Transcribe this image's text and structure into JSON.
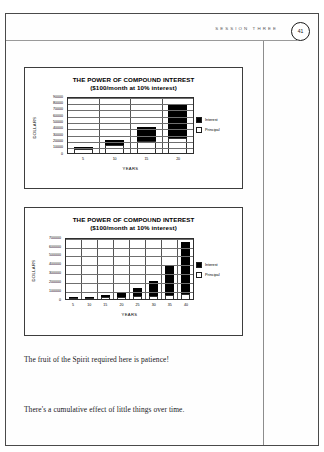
{
  "header": {
    "session_label": "SESSION THREE",
    "page_number": "41"
  },
  "charts": [
    {
      "title": "THE POWER OF COMPOUND INTEREST",
      "subtitle": "($100/month at 10% interest)",
      "ylabel": "DOLLARS",
      "xlabel": "YEARS",
      "legend": [
        {
          "label": "Interest",
          "swatch": "filled"
        },
        {
          "label": "Principal",
          "swatch": "hollow"
        }
      ]
    },
    {
      "title": "THE POWER OF COMPOUND INTEREST",
      "subtitle": "($100/month at 10% interest)",
      "ylabel": "DOLLARS",
      "xlabel": "YEARS",
      "legend": [
        {
          "label": "Interest",
          "swatch": "filled"
        },
        {
          "label": "Principal",
          "swatch": "hollow"
        }
      ]
    }
  ],
  "body": {
    "line_1": "The fruit of the Spirit required here is patience!",
    "line_2": "There's a cumulative effect of little things over time."
  },
  "chart_data": [
    {
      "type": "bar",
      "stacked": true,
      "title": "THE POWER OF COMPOUND INTEREST",
      "subtitle": "($100/month at 10% interest)",
      "xlabel": "YEARS",
      "ylabel": "DOLLARS",
      "categories": [
        "5",
        "10",
        "15",
        "20"
      ],
      "ytick_labels": [
        "90000",
        "80000",
        "70000",
        "60000",
        "50000",
        "40000",
        "30000",
        "20000",
        "10000",
        "0"
      ],
      "ylim": [
        0,
        90000
      ],
      "ytick_step": 10000,
      "grid": true,
      "legend_position": "right",
      "series": [
        {
          "name": "Principal",
          "color": "#ffffff",
          "values": [
            6000,
            12000,
            18000,
            24000
          ]
        },
        {
          "name": "Interest",
          "color": "#000000",
          "values": [
            3800,
            8200,
            22000,
            52000
          ]
        }
      ],
      "totals": [
        9800,
        20200,
        40000,
        76000
      ]
    },
    {
      "type": "bar",
      "stacked": true,
      "title": "THE POWER OF COMPOUND INTEREST",
      "subtitle": "($100/month at 10% interest)",
      "xlabel": "YEARS",
      "ylabel": "DOLLARS",
      "categories": [
        "5",
        "10",
        "15",
        "20",
        "25",
        "30",
        "35",
        "40"
      ],
      "ytick_labels": [
        "700000",
        "600000",
        "500000",
        "400000",
        "300000",
        "200000",
        "100000",
        "0"
      ],
      "ylim": [
        0,
        700000
      ],
      "ytick_step": 100000,
      "grid": true,
      "legend_position": "right",
      "series": [
        {
          "name": "Principal",
          "color": "#ffffff",
          "values": [
            6000,
            12000,
            18000,
            24000,
            30000,
            36000,
            42000,
            48000
          ]
        },
        {
          "name": "Interest",
          "color": "#000000",
          "values": [
            3800,
            8200,
            22000,
            52000,
            91000,
            164000,
            338000,
            587000
          ]
        }
      ],
      "totals": [
        9800,
        20200,
        40000,
        76000,
        121000,
        200000,
        380000,
        635000
      ]
    }
  ]
}
